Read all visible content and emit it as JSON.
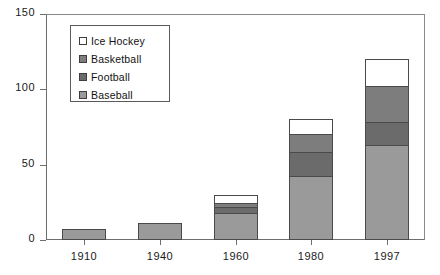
{
  "chart_data": {
    "type": "bar",
    "title": "",
    "subtitle": "",
    "xlabel": "",
    "ylabel": "",
    "stacked": true,
    "grid": false,
    "legend_position": "upper-left-inside",
    "categories": [
      "1910",
      "1940",
      "1960",
      "1980",
      "1997"
    ],
    "ylim": [
      0,
      150
    ],
    "yticks": [
      0,
      50,
      100,
      150
    ],
    "ytick_labels": [
      "0",
      "50",
      "100",
      "150"
    ],
    "series": [
      {
        "name": "Baseball",
        "color": "#9a9a9a",
        "values": [
          7,
          11,
          18,
          42,
          63
        ]
      },
      {
        "name": "Football",
        "color": "#6b6b6b",
        "values": [
          0,
          0,
          4,
          16,
          15
        ]
      },
      {
        "name": "Basketball",
        "color": "#7d7d7d",
        "values": [
          0,
          0,
          3,
          12,
          24
        ]
      },
      {
        "name": "Ice Hockey",
        "color": "#ffffff",
        "values": [
          0,
          0,
          5,
          10,
          18
        ]
      }
    ],
    "totals": [
      7,
      11,
      30,
      80,
      120
    ]
  },
  "legend": {
    "items": [
      {
        "label": "Ice Hockey",
        "color": "#ffffff"
      },
      {
        "label": "Basketball",
        "color": "#7d7d7d"
      },
      {
        "label": "Football",
        "color": "#6b6b6b"
      },
      {
        "label": "Baseball",
        "color": "#9a9a9a"
      }
    ]
  }
}
